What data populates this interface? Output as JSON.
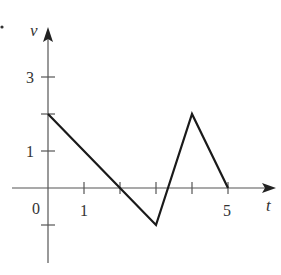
{
  "chart_data": {
    "type": "line",
    "title": "",
    "xlabel": "t",
    "ylabel": "v",
    "x": [
      0,
      2,
      3,
      4,
      5
    ],
    "series": [
      {
        "name": "v(t)",
        "values": [
          2,
          0,
          -1,
          2,
          0
        ]
      }
    ],
    "x_ticks": [
      1,
      2,
      3,
      4,
      5
    ],
    "x_tick_labels": [
      "1",
      "",
      "",
      "",
      "5"
    ],
    "y_ticks": [
      -1,
      1,
      2,
      3
    ],
    "y_tick_labels": [
      "",
      "1",
      "",
      "3"
    ],
    "origin_label": "0",
    "xlim": [
      -0.5,
      6.3
    ],
    "ylim": [
      -2.0,
      4.2
    ],
    "grid": false,
    "legend": null
  },
  "labels": {
    "x_axis": "t",
    "y_axis": "v",
    "origin": "0",
    "x_tick_1": "1",
    "x_tick_5": "5",
    "y_tick_1": "1",
    "y_tick_3": "3"
  },
  "colors": {
    "axis": "#555555",
    "line": "#1a1a1a",
    "text": "#333333"
  }
}
